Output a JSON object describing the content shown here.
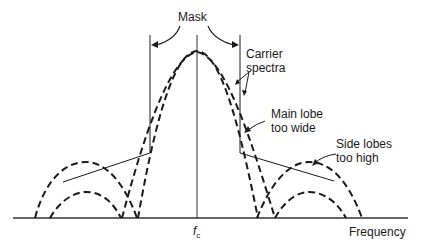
{
  "labels": {
    "mask": "Mask",
    "carrier_spectra_line1": "Carrier",
    "carrier_spectra_line2": "spectra",
    "main_lobe_line1": "Main lobe",
    "main_lobe_line2": "too wide",
    "side_lobes_line1": "Side lobes",
    "side_lobes_line2": "too high",
    "x_axis": "Frequency",
    "center_freq_symbol": "f",
    "center_freq_subscript": "c"
  },
  "colors": {
    "stroke": "#1a1a1a",
    "axis": "#333333",
    "background": "#ffffff"
  },
  "geometry": {
    "baseline_y": 218,
    "center_x": 197,
    "mask_left_x": 150,
    "mask_right_x": 240,
    "mask_corner_y": 153
  }
}
